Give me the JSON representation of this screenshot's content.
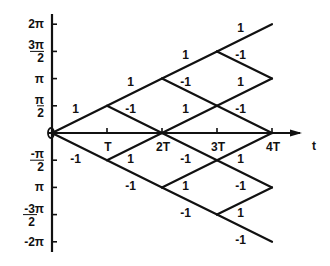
{
  "diagram": {
    "type": "phase-lattice",
    "axes": {
      "x_label": "t",
      "x_ticks": [
        {
          "value": 1,
          "label": "T"
        },
        {
          "value": 2,
          "label": "2T"
        },
        {
          "value": 3,
          "label": "3T"
        },
        {
          "value": 4,
          "label": "4T"
        }
      ],
      "y_ticks": [
        {
          "value": 4,
          "label": "2π"
        },
        {
          "value": 3,
          "label": "3π/2",
          "num": "3π",
          "den": "2"
        },
        {
          "value": 2,
          "label": "π"
        },
        {
          "value": 1,
          "label": "π/2",
          "num": "π",
          "den": "2"
        },
        {
          "value": -1,
          "label": "-π/2",
          "num": "-π",
          "den": "2"
        },
        {
          "value": -2,
          "label": "π"
        },
        {
          "value": -3,
          "label": "-3π/2",
          "num": "-3π",
          "den": "2"
        },
        {
          "value": -4,
          "label": "-2π"
        }
      ],
      "origin_label": "0"
    },
    "segments": [
      {
        "from": [
          0,
          0
        ],
        "to": [
          1,
          1
        ],
        "label": "1"
      },
      {
        "from": [
          1,
          1
        ],
        "to": [
          2,
          2
        ],
        "label": "1"
      },
      {
        "from": [
          2,
          2
        ],
        "to": [
          3,
          3
        ],
        "label": "1"
      },
      {
        "from": [
          3,
          3
        ],
        "to": [
          4,
          4
        ],
        "label": "1"
      },
      {
        "from": [
          1,
          1
        ],
        "to": [
          2,
          0
        ],
        "label": "-1"
      },
      {
        "from": [
          2,
          2
        ],
        "to": [
          3,
          1
        ],
        "label": "-1"
      },
      {
        "from": [
          3,
          1
        ],
        "to": [
          4,
          0
        ],
        "label": "-1"
      },
      {
        "from": [
          3,
          3
        ],
        "to": [
          4,
          2
        ],
        "label": "-1"
      },
      {
        "from": [
          2,
          0
        ],
        "to": [
          3,
          1
        ],
        "label": "1"
      },
      {
        "from": [
          3,
          1
        ],
        "to": [
          4,
          2
        ],
        "label": "1"
      },
      {
        "from": [
          0,
          0
        ],
        "to": [
          1,
          -1
        ],
        "label": "-1"
      },
      {
        "from": [
          1,
          -1
        ],
        "to": [
          2,
          -2
        ],
        "label": "-1"
      },
      {
        "from": [
          2,
          -2
        ],
        "to": [
          3,
          -3
        ],
        "label": "-1"
      },
      {
        "from": [
          3,
          -3
        ],
        "to": [
          4,
          -4
        ],
        "label": "-1"
      },
      {
        "from": [
          1,
          -1
        ],
        "to": [
          2,
          0
        ],
        "label": "1"
      },
      {
        "from": [
          2,
          -2
        ],
        "to": [
          3,
          -1
        ],
        "label": "1"
      },
      {
        "from": [
          3,
          -1
        ],
        "to": [
          4,
          0
        ],
        "label": "1"
      },
      {
        "from": [
          3,
          -3
        ],
        "to": [
          4,
          -2
        ],
        "label": "1"
      },
      {
        "from": [
          2,
          0
        ],
        "to": [
          3,
          -1
        ],
        "label": "-1"
      },
      {
        "from": [
          3,
          -1
        ],
        "to": [
          4,
          -2
        ],
        "label": "-1"
      }
    ]
  }
}
